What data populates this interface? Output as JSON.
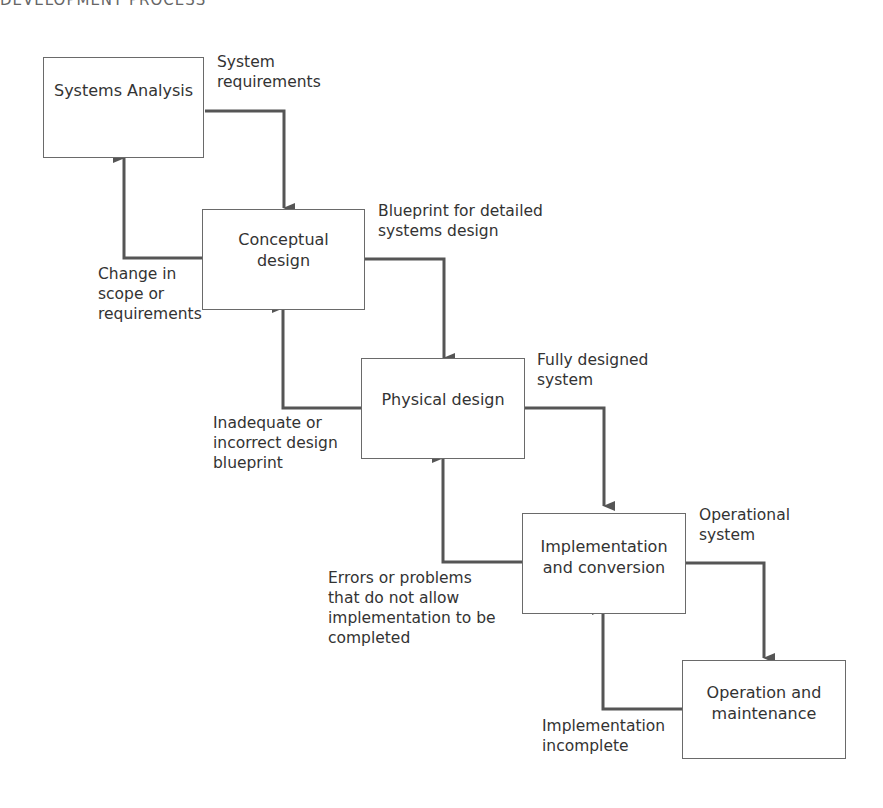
{
  "header": {
    "clipped_title": "DEVELOPMENT PROCESS"
  },
  "stages": [
    {
      "id": "systems-analysis",
      "label": "Systems Analysis"
    },
    {
      "id": "conceptual-design",
      "label": "Conceptual\ndesign"
    },
    {
      "id": "physical-design",
      "label": "Physical design"
    },
    {
      "id": "implementation-conversion",
      "label": "Implementation\nand conversion"
    },
    {
      "id": "operation-maintenance",
      "label": "Operation and\nmaintenance"
    }
  ],
  "forward_flows": [
    {
      "from": "systems-analysis",
      "to": "conceptual-design",
      "label": "System\nrequirements"
    },
    {
      "from": "conceptual-design",
      "to": "physical-design",
      "label": "Blueprint for detailed\nsystems design"
    },
    {
      "from": "physical-design",
      "to": "implementation-conversion",
      "label": "Fully designed\nsystem"
    },
    {
      "from": "implementation-conversion",
      "to": "operation-maintenance",
      "label": "Operational\nsystem"
    }
  ],
  "feedback_flows": [
    {
      "from": "conceptual-design",
      "to": "systems-analysis",
      "label": "Change in\nscope or\nrequirements"
    },
    {
      "from": "physical-design",
      "to": "conceptual-design",
      "label": "Inadequate or\nincorrect design\nblueprint"
    },
    {
      "from": "implementation-conversion",
      "to": "physical-design",
      "label": "Errors or problems\nthat do not allow\nimplementation to be\ncompleted"
    },
    {
      "from": "operation-maintenance",
      "to": "implementation-conversion",
      "label": "Implementation\nincomplete"
    }
  ],
  "colors": {
    "line": "#555555",
    "box_border": "#6a6a6a",
    "text": "#333333"
  }
}
